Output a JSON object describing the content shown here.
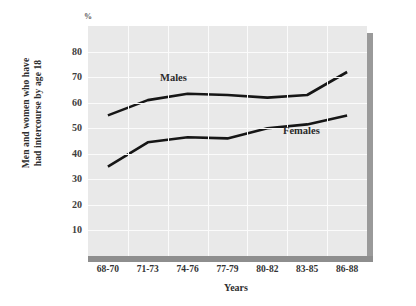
{
  "chart_data": {
    "type": "line",
    "title": "",
    "subtitle": "",
    "unit_marker": "%",
    "xlabel": "Years",
    "ylabel_line1": "Men and women who have",
    "ylabel_line2": "had intercourse by age 18",
    "categories": [
      "68-70",
      "71-73",
      "74-76",
      "77-79",
      "80-82",
      "83-85",
      "86-88"
    ],
    "yticks": [
      10,
      20,
      30,
      40,
      50,
      60,
      70,
      80
    ],
    "ylim": [
      0,
      90
    ],
    "grid": true,
    "legend_position": "inline-annotation",
    "series": [
      {
        "name": "Males",
        "color": "#161616",
        "values": [
          55,
          61,
          63.5,
          63,
          62,
          63,
          72
        ]
      },
      {
        "name": "Females",
        "color": "#161616",
        "values": [
          35,
          44.5,
          46.5,
          46,
          50,
          51.5,
          55
        ]
      }
    ]
  },
  "style": {
    "plot_background": "#e9e9e9",
    "gridline_color": "#fbfbfb",
    "shadow_color": "#8e8e8e",
    "page_background": "#ffffff"
  }
}
